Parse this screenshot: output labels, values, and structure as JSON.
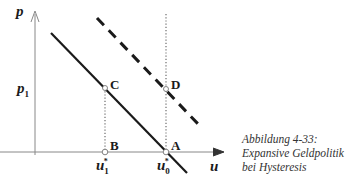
{
  "axes": {
    "y_label": "p",
    "x_label": "u",
    "y_tick_label": "p",
    "y_tick_sub": "1"
  },
  "points": {
    "A": "A",
    "B": "B",
    "C": "C",
    "D": "D"
  },
  "x_ticks": [
    {
      "base": "u",
      "sub": "1",
      "sup": "*"
    },
    {
      "base": "u",
      "sub": "0",
      "sup": "*"
    }
  ],
  "caption": {
    "line1": "Abbildung 4-33:",
    "line2": "Expansive Geldpolitik",
    "line3": "bei Hysteresis"
  },
  "colors": {
    "line": "#1a1a1a",
    "axis": "#888888",
    "dotted": "#777777"
  }
}
